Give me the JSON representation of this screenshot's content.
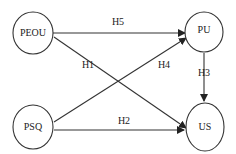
{
  "diagram": {
    "nodes": [
      {
        "id": "PEOU",
        "label": "PEOU"
      },
      {
        "id": "PU",
        "label": "PU"
      },
      {
        "id": "PSQ",
        "label": "PSQ"
      },
      {
        "id": "US",
        "label": "US"
      }
    ],
    "edges": [
      {
        "id": "H1",
        "label": "H1",
        "from": "PEOU",
        "to": "US"
      },
      {
        "id": "H2",
        "label": "H2",
        "from": "PSQ",
        "to": "US"
      },
      {
        "id": "H3",
        "label": "H3",
        "from": "PU",
        "to": "US"
      },
      {
        "id": "H4",
        "label": "H4",
        "from": "PSQ",
        "to": "PU"
      },
      {
        "id": "H5",
        "label": "H5",
        "from": "PEOU",
        "to": "PU"
      }
    ],
    "colors": {
      "stroke": "#333333",
      "text": "#222222",
      "background": "#ffffff"
    }
  }
}
